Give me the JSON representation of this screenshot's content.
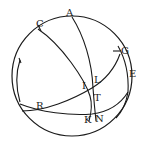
{
  "diagram": {
    "type": "spherical-geometry",
    "stroke_color": "#1a1a1a",
    "background": "#ffffff",
    "labels": {
      "A": "A",
      "C": "C",
      "G": "G",
      "E": "E",
      "I": "I",
      "L": "L",
      "T": "T",
      "R": "R",
      "K": "K",
      "N": "N"
    }
  }
}
